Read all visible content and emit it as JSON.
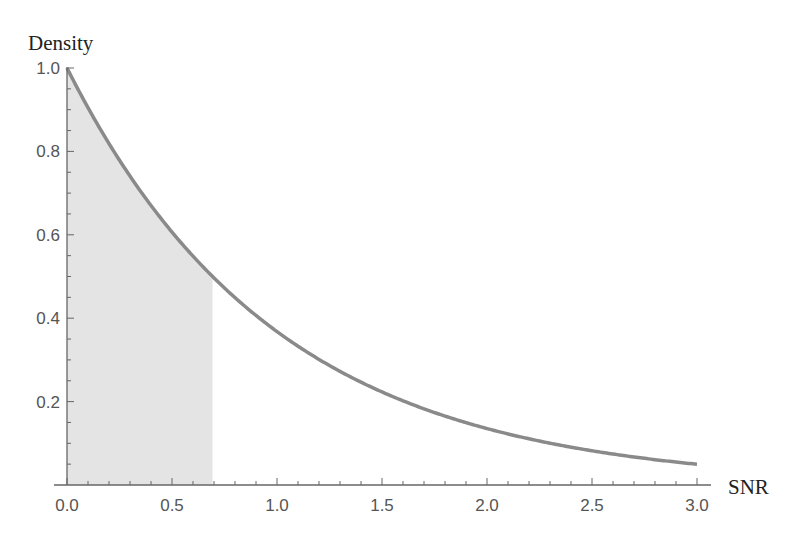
{
  "chart_data": {
    "type": "area",
    "title": "",
    "xlabel": "SNR",
    "ylabel": "Density",
    "xlim": [
      0.0,
      3.0
    ],
    "ylim": [
      0.0,
      1.0
    ],
    "x_ticks": [
      "0.0",
      "0.5",
      "1.0",
      "1.5",
      "2.0",
      "2.5",
      "3.0"
    ],
    "y_ticks": [
      "0.2",
      "0.4",
      "0.6",
      "0.8",
      "1.0"
    ],
    "grid": false,
    "legend": null,
    "series": [
      {
        "name": "density curve",
        "function": "exp(-x)",
        "x": [
          0.0,
          0.25,
          0.5,
          0.693,
          1.0,
          1.25,
          1.5,
          1.75,
          2.0,
          2.25,
          2.5,
          2.75,
          3.0
        ],
        "y": [
          1.0,
          0.78,
          0.61,
          0.5,
          0.37,
          0.29,
          0.22,
          0.17,
          0.14,
          0.11,
          0.08,
          0.06,
          0.05
        ],
        "color": "#8a8a8a"
      }
    ],
    "shaded_region": {
      "x_from": 0.0,
      "x_to": 0.693,
      "description": "area under the curve from 0 to ln 2 (probability 0.5)",
      "color": "#e4e4e4"
    }
  },
  "colors": {
    "curve": "#8a8a8a",
    "shade": "#e4e4e4",
    "axis": "#666666",
    "tick_label": "#555555",
    "axis_title": "#222222"
  }
}
